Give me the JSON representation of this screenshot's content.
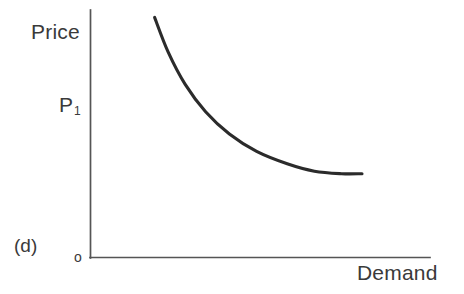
{
  "figure": {
    "caption": "(d)",
    "origin_label": "o",
    "background_color": "#ffffff",
    "curve_color": "#2b2b2b",
    "axis_color": "#555555",
    "text_color": "#3a3a3a"
  },
  "chart_data": {
    "type": "line",
    "title": "",
    "subtitle": "",
    "xlabel": "Demand",
    "ylabel": "Price",
    "grid": false,
    "legend": null,
    "annotations": [
      {
        "name": "price-level",
        "text": "P₁",
        "axis": "y",
        "value": 0.66
      },
      {
        "name": "origin",
        "text": "o",
        "axis": "origin",
        "value": 0
      },
      {
        "name": "figure-caption",
        "text": "(d)"
      }
    ],
    "axis_ranges": {
      "x": [
        0,
        1
      ],
      "y": [
        0,
        1
      ]
    },
    "tick_labels": {
      "x": [],
      "y": [
        "P₁"
      ]
    },
    "series": [
      {
        "name": "Demand curve",
        "color": "#2b2b2b",
        "points": [
          {
            "x": 0.19,
            "y": 0.97
          },
          {
            "x": 0.23,
            "y": 0.83
          },
          {
            "x": 0.28,
            "y": 0.7
          },
          {
            "x": 0.34,
            "y": 0.59
          },
          {
            "x": 0.41,
            "y": 0.5
          },
          {
            "x": 0.49,
            "y": 0.43
          },
          {
            "x": 0.58,
            "y": 0.38
          },
          {
            "x": 0.66,
            "y": 0.35
          },
          {
            "x": 0.74,
            "y": 0.34
          },
          {
            "x": 0.8,
            "y": 0.34
          }
        ]
      }
    ]
  },
  "labels": {
    "price": "Price",
    "price_level": "P",
    "price_level_subscript": "1",
    "demand": "Demand"
  }
}
